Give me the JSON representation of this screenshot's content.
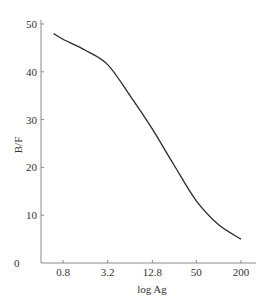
{
  "chart_data": {
    "type": "line",
    "title": "",
    "xlabel": "log Ag",
    "ylabel": "B/F",
    "x_scale": "log",
    "x_ticks": [
      "0.8",
      "3.2",
      "12.8",
      "50",
      "200"
    ],
    "y_ticks": [
      "0",
      "10",
      "20",
      "30",
      "40",
      "50"
    ],
    "ylim": [
      0,
      50
    ],
    "grid": false,
    "legend": null,
    "series": [
      {
        "name": "B/F",
        "x": [
          0.6,
          0.8,
          1.6,
          3.2,
          6.4,
          12.8,
          25,
          50,
          100,
          200
        ],
        "values": [
          48,
          46.8,
          44.5,
          41.5,
          35,
          28,
          20.5,
          13,
          8,
          5
        ]
      }
    ]
  },
  "axes": {
    "xlabel": "log Ag",
    "ylabel": "B/F",
    "x_ticks": [
      "0.8",
      "3.2",
      "12.8",
      "50",
      "200"
    ],
    "y_ticks": [
      "0",
      "10",
      "20",
      "30",
      "40",
      "50"
    ]
  },
  "colors": {
    "axis": "#8a8a8a",
    "curve": "#2b2b2b",
    "text": "#333333"
  }
}
